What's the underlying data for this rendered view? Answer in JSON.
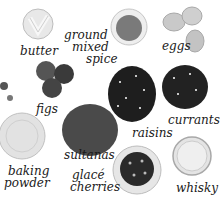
{
  "ingredients": [
    {
      "id": "butter",
      "label": "butter"
    },
    {
      "id": "ground-mixed-spice",
      "label_line1": "ground",
      "label_line2": "mixed",
      "label_line3": "spice"
    },
    {
      "id": "eggs",
      "label": "eggs"
    },
    {
      "id": "figs",
      "label": "figs"
    },
    {
      "id": "raisins",
      "label": "raisins"
    },
    {
      "id": "currants",
      "label": "currants"
    },
    {
      "id": "sultanas",
      "label": "sultanas"
    },
    {
      "id": "baking-powder",
      "label_line1": "baking",
      "label_line2": "powder"
    },
    {
      "id": "glace-cherries",
      "label_line1": "glacé",
      "label_line2": "cherries"
    },
    {
      "id": "whisky",
      "label": "whisky"
    }
  ],
  "colors": {
    "background": "#ffffff",
    "text": "#1a1a1a",
    "dried_fruit": "#222222",
    "dish": "#e6e6e6",
    "egg": "#c8c8c8",
    "spice": "#777777"
  }
}
